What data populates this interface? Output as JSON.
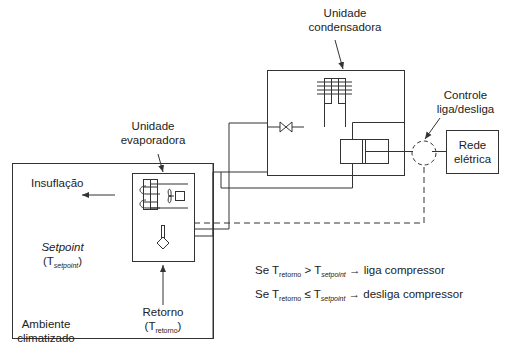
{
  "labels": {
    "condenser_unit": [
      "Unidade",
      "condensadora"
    ],
    "evaporator_unit": [
      "Unidade",
      "evaporadora"
    ],
    "on_off_control": [
      "Controle",
      "liga/desliga"
    ],
    "power_grid": [
      "Rede",
      "elétrica"
    ],
    "supply_air": "Insuflação",
    "setpoint_title": "Setpoint",
    "setpoint_symbol": "T",
    "setpoint_sub": "setpoint",
    "return_title": "Retorno",
    "return_symbol": "T",
    "return_sub": "retorno",
    "room": [
      "Ambiente",
      "climatizado"
    ]
  },
  "rules": [
    {
      "prefix": "Se T",
      "lhs_sub": "retorno",
      "operator": ">",
      "rhs": "T",
      "rhs_sub": "setpoint",
      "arrow": "→",
      "action": "liga compressor"
    },
    {
      "prefix": "Se T",
      "lhs_sub": "retorno",
      "operator": "≤",
      "rhs": "T",
      "rhs_sub": "setpoint",
      "arrow": "→",
      "action": "desliga compressor"
    }
  ],
  "colors": {
    "line": "#333333",
    "text": "#222222",
    "background": "#ffffff"
  }
}
